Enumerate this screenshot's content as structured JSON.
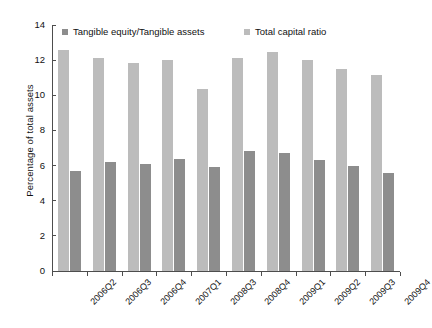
{
  "chart_data": {
    "type": "bar",
    "title": "",
    "xlabel": "",
    "ylabel": "Percentage of total assets",
    "ylim": [
      0,
      14
    ],
    "yticks": [
      0,
      2,
      4,
      6,
      8,
      10,
      12,
      14
    ],
    "grid": false,
    "legend_position": "top",
    "categories": [
      "2006Q2",
      "2006Q3",
      "2006Q4",
      "2007Q1",
      "2008Q3",
      "2008Q4",
      "2009Q1",
      "2009Q2",
      "2009Q3",
      "2009Q4"
    ],
    "series": [
      {
        "name": "Total capital ratio",
        "color": "#bcbcbc",
        "values": [
          12.55,
          12.1,
          11.85,
          12.0,
          10.35,
          12.1,
          12.45,
          12.0,
          11.5,
          11.15
        ]
      },
      {
        "name": "Tangible equity/Tangible assets",
        "color": "#8d8d8d",
        "values": [
          5.7,
          6.2,
          6.1,
          6.4,
          5.9,
          6.85,
          6.7,
          6.3,
          6.0,
          5.6
        ]
      }
    ],
    "legend": [
      {
        "label": "Tangible equity/Tangible assets",
        "color": "#8d8d8d"
      },
      {
        "label": "Total capital ratio",
        "color": "#bcbcbc"
      }
    ]
  }
}
